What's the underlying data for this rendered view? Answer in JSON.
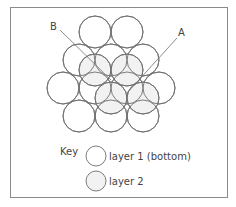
{
  "diagram": {
    "labels": {
      "A": "A",
      "B": "B"
    },
    "colors": {
      "stroke": "#6e6e6e",
      "layer1_fill": "none",
      "layer2_fill": "#f2f2f2",
      "frame": "#8a8a8a",
      "text": "#444444"
    },
    "circle_radius": 16,
    "layer1": [
      {
        "cx": 95,
        "cy": 32
      },
      {
        "cx": 127,
        "cy": 32
      },
      {
        "cx": 79,
        "cy": 60
      },
      {
        "cx": 111,
        "cy": 60
      },
      {
        "cx": 143,
        "cy": 60
      },
      {
        "cx": 63,
        "cy": 88
      },
      {
        "cx": 95,
        "cy": 88
      },
      {
        "cx": 127,
        "cy": 88
      },
      {
        "cx": 159,
        "cy": 88
      },
      {
        "cx": 79,
        "cy": 116
      },
      {
        "cx": 111,
        "cy": 116
      },
      {
        "cx": 143,
        "cy": 116
      }
    ],
    "layer2": [
      {
        "cx": 95,
        "cy": 70
      },
      {
        "cx": 127,
        "cy": 70
      },
      {
        "cx": 111,
        "cy": 98
      },
      {
        "cx": 143,
        "cy": 98
      }
    ],
    "pointer_lines": {
      "A": {
        "x1": 177,
        "y1": 38,
        "x2": 127,
        "y2": 93
      },
      "B": {
        "x1": 60,
        "y1": 30,
        "x2": 111,
        "y2": 80
      }
    }
  },
  "key": {
    "title": "Key",
    "items": [
      {
        "label": "layer 1 (bottom)"
      },
      {
        "label": "layer 2"
      }
    ]
  }
}
